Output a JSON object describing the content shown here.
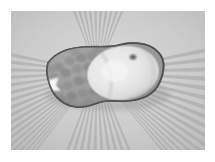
{
  "page": {
    "background_color": "#ffffff",
    "width": 215,
    "height": 162
  },
  "photo": {
    "name": "grayscale-fruit-photograph",
    "color_mode": "grayscale",
    "frame": {
      "x": 11,
      "y": 11,
      "width": 194,
      "height": 139
    },
    "background": {
      "type": "radial-sunburst",
      "description": "Alternating light and mid-gray rays radiating outward from a center behind the object",
      "center": {
        "x": 97,
        "y": 72
      },
      "ray_count": 72,
      "ray_light_color": "#e2e2e2",
      "ray_dark_color": "#b4b4b4",
      "base_color": "#cccccc",
      "vignette_color": "#bdbdbd"
    },
    "subject": {
      "label": "fruit-object",
      "description": "Elongated blob-shaped object lying horizontally across the center of the frame",
      "bounds": {
        "x": 46,
        "y": 42,
        "width": 114,
        "height": 58
      },
      "outline_color": "#4a4a4a",
      "parts": [
        {
          "name": "textured-left-half",
          "description": "Bumpy, pitted darker gray surface resembling pineapple or strawberry skin",
          "fill_color": "#9a9a9a",
          "shadow_color": "#7d7d7d",
          "bump_count": 26
        },
        {
          "name": "bright-right-half",
          "description": "Large bright rounded lobe, smooth pale surface like a peeled or cut citrus fruit",
          "fill_color": "#e8e8e8",
          "highlight_color": "#f6f6f6",
          "rim_color": "#c2c2c2"
        },
        {
          "name": "inner-segment-arc",
          "description": "Faint curved arc inside the bright lobe suggesting fruit segments",
          "stroke_color": "#cfcfcf"
        },
        {
          "name": "stem-spot",
          "description": "Small dark spot at the upper right of the bright lobe, like a stem scar",
          "position": {
            "x": 133,
            "y": 57
          },
          "fill_color": "#5a5a5a"
        },
        {
          "name": "left-highlight-notch",
          "description": "Bright white wedge-shaped highlight on the left edge of the object",
          "position": {
            "x": 57,
            "y": 82
          },
          "fill_color": "#fafafa"
        },
        {
          "name": "cast-shadow",
          "description": "Soft dark shadow under the lower edge of the object",
          "fill_color": "#6e6e6e"
        }
      ]
    }
  }
}
